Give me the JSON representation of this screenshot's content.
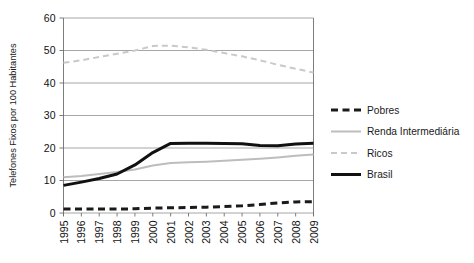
{
  "chart_data": {
    "type": "line",
    "title": "",
    "xlabel": "",
    "ylabel": "Telefones Fixos por 100 Habitantes",
    "ylim": [
      0,
      60
    ],
    "yticks": [
      0,
      10,
      20,
      30,
      40,
      50,
      60
    ],
    "grid": true,
    "legend_position": "right",
    "categories": [
      "1995",
      "1996",
      "1997",
      "1998",
      "1999",
      "2000",
      "2001",
      "2002",
      "2003",
      "2004",
      "2005",
      "2006",
      "2007",
      "2008",
      "2009"
    ],
    "series": [
      {
        "name": "Pobres",
        "style": "dashed",
        "color": "#1a1a1a",
        "values": [
          1.2,
          1.2,
          1.2,
          1.2,
          1.3,
          1.5,
          1.6,
          1.7,
          1.8,
          2.0,
          2.2,
          2.6,
          3.1,
          3.4,
          3.5
        ]
      },
      {
        "name": "Renda Intermediária",
        "style": "solid",
        "color": "#bdbdbd",
        "values": [
          11.0,
          11.4,
          12.0,
          12.6,
          13.4,
          14.6,
          15.4,
          15.6,
          15.8,
          16.1,
          16.4,
          16.7,
          17.1,
          17.6,
          18.0
        ]
      },
      {
        "name": "Ricos",
        "style": "dashed",
        "color": "#c9c9c9",
        "values": [
          46.2,
          47.0,
          48.0,
          49.0,
          50.0,
          51.4,
          51.5,
          51.0,
          50.2,
          49.2,
          48.2,
          47.0,
          45.6,
          44.4,
          43.2
        ]
      },
      {
        "name": "Brasil",
        "style": "solid",
        "color": "#111111",
        "values": [
          8.5,
          9.5,
          10.6,
          12.0,
          14.8,
          18.6,
          21.4,
          21.5,
          21.5,
          21.4,
          21.3,
          20.8,
          20.7,
          21.2,
          21.5
        ]
      }
    ]
  },
  "legend": {
    "items": [
      {
        "label": "Pobres"
      },
      {
        "label": "Renda Intermediária"
      },
      {
        "label": "Ricos"
      },
      {
        "label": "Brasil"
      }
    ]
  }
}
